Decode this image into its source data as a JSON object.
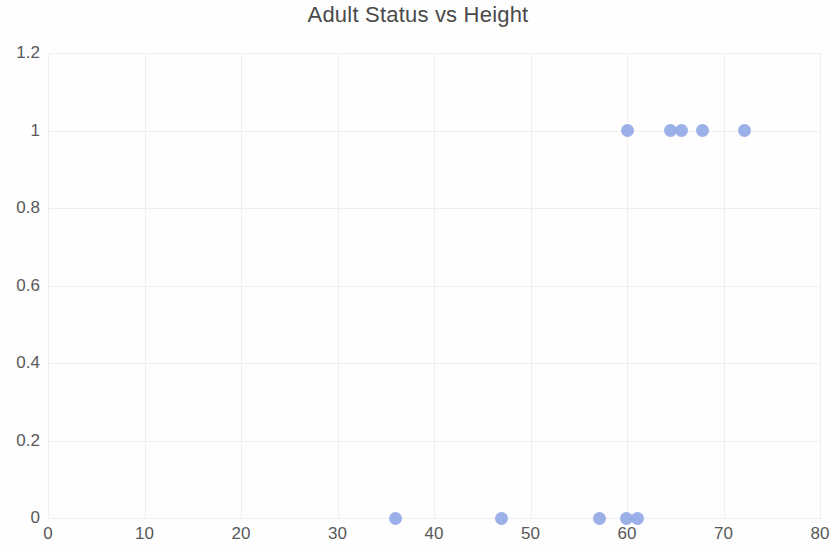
{
  "chart_data": {
    "type": "scatter",
    "title": "Adult Status vs Height",
    "xlabel": "",
    "ylabel": "",
    "xlim": [
      0,
      80
    ],
    "ylim": [
      0,
      1.2
    ],
    "grid": true,
    "legend": false,
    "legend_position": "none",
    "marker_color": "#93a8e6",
    "xticks": [
      "0",
      "10",
      "20",
      "30",
      "40",
      "50",
      "60",
      "70",
      "80"
    ],
    "xtick_values": [
      0,
      10,
      20,
      30,
      40,
      50,
      60,
      70,
      80
    ],
    "yticks": [
      "0",
      "0.2",
      "0.4",
      "0.6",
      "0.8",
      "1",
      "1.2"
    ],
    "ytick_values": [
      0,
      0.2,
      0.4,
      0.6,
      0.8,
      1,
      1.2
    ],
    "series": [
      {
        "name": "Adult Status",
        "points": [
          {
            "x": 36.0,
            "y": 0
          },
          {
            "x": 47.0,
            "y": 0
          },
          {
            "x": 57.2,
            "y": 0
          },
          {
            "x": 59.9,
            "y": 0
          },
          {
            "x": 61.1,
            "y": 0
          },
          {
            "x": 60.0,
            "y": 1
          },
          {
            "x": 64.5,
            "y": 1
          },
          {
            "x": 65.6,
            "y": 1
          },
          {
            "x": 67.8,
            "y": 1
          },
          {
            "x": 72.2,
            "y": 1
          }
        ]
      }
    ]
  }
}
